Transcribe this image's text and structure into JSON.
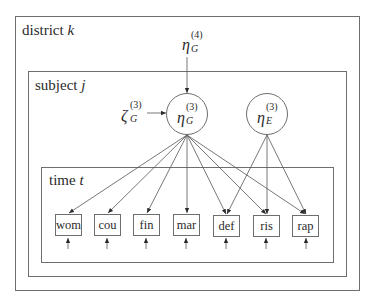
{
  "plates": {
    "district": {
      "label": "district",
      "index": "k"
    },
    "subject": {
      "label": "subject",
      "index": "j"
    },
    "time": {
      "label": "time",
      "index": "t"
    }
  },
  "latent": {
    "eta_G4": {
      "symbol": "η",
      "sub": "G",
      "sup": "(4)"
    },
    "eta_G3": {
      "symbol": "η",
      "sub": "G",
      "sup": "(3)"
    },
    "eta_E3": {
      "symbol": "η",
      "sub": "E",
      "sup": "(3)"
    },
    "zeta_G3": {
      "symbol": "ζ",
      "sub": "G",
      "sup": "(3)"
    }
  },
  "items": [
    {
      "id": "wom",
      "label": "wom"
    },
    {
      "id": "cou",
      "label": "cou"
    },
    {
      "id": "fin",
      "label": "fin"
    },
    {
      "id": "mar",
      "label": "mar"
    },
    {
      "id": "def",
      "label": "def"
    },
    {
      "id": "ris",
      "label": "ris"
    },
    {
      "id": "rap",
      "label": "rap"
    }
  ],
  "edges": {
    "eta_G3_to": [
      "wom",
      "cou",
      "fin",
      "mar",
      "def",
      "ris",
      "rap"
    ],
    "eta_E3_to": [
      "def",
      "ris",
      "rap"
    ]
  },
  "colors": {
    "line": "#6e6e6e",
    "arrow": "#2a2a2a",
    "text": "#2a2a2a"
  }
}
